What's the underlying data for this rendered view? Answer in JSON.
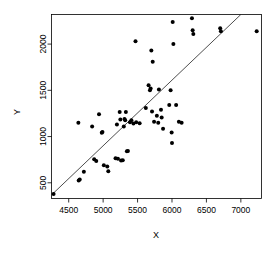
{
  "chart_data": {
    "type": "scatter",
    "title": "",
    "xlabel": "X",
    "ylabel": "Y",
    "xlim": [
      4250,
      7300
    ],
    "ylim": [
      330,
      2320
    ],
    "grid": false,
    "legend": null,
    "xticks": [
      4500,
      5000,
      5500,
      6000,
      6500,
      7000
    ],
    "yticks": [
      500,
      1000,
      1500,
      2000
    ],
    "point_color": "#000000",
    "line_color": "#000000",
    "reference_line": {
      "description": "diagonal regression line",
      "x_start": 4260,
      "y_start": 375,
      "x_end": 7000,
      "y_end": 2320
    },
    "points": [
      {
        "x": 4280,
        "y": 380
      },
      {
        "x": 4640,
        "y": 1150
      },
      {
        "x": 4645,
        "y": 525
      },
      {
        "x": 4660,
        "y": 535
      },
      {
        "x": 4720,
        "y": 620
      },
      {
        "x": 4840,
        "y": 1110
      },
      {
        "x": 4870,
        "y": 755
      },
      {
        "x": 4900,
        "y": 735
      },
      {
        "x": 4940,
        "y": 1240
      },
      {
        "x": 4980,
        "y": 1040
      },
      {
        "x": 4990,
        "y": 1050
      },
      {
        "x": 5010,
        "y": 690
      },
      {
        "x": 5060,
        "y": 675
      },
      {
        "x": 5075,
        "y": 625
      },
      {
        "x": 5180,
        "y": 765
      },
      {
        "x": 5200,
        "y": 1130
      },
      {
        "x": 5215,
        "y": 760
      },
      {
        "x": 5240,
        "y": 1265
      },
      {
        "x": 5250,
        "y": 1185
      },
      {
        "x": 5260,
        "y": 740
      },
      {
        "x": 5285,
        "y": 745
      },
      {
        "x": 5300,
        "y": 1110
      },
      {
        "x": 5310,
        "y": 1190
      },
      {
        "x": 5320,
        "y": 1175
      },
      {
        "x": 5330,
        "y": 1265
      },
      {
        "x": 5345,
        "y": 840
      },
      {
        "x": 5360,
        "y": 845
      },
      {
        "x": 5390,
        "y": 1155
      },
      {
        "x": 5410,
        "y": 1175
      },
      {
        "x": 5440,
        "y": 1140
      },
      {
        "x": 5470,
        "y": 2030
      },
      {
        "x": 5480,
        "y": 1155
      },
      {
        "x": 5530,
        "y": 1145
      },
      {
        "x": 5620,
        "y": 1310
      },
      {
        "x": 5660,
        "y": 1555
      },
      {
        "x": 5680,
        "y": 1500
      },
      {
        "x": 5690,
        "y": 1520
      },
      {
        "x": 5700,
        "y": 1930
      },
      {
        "x": 5710,
        "y": 1270
      },
      {
        "x": 5720,
        "y": 1810
      },
      {
        "x": 5740,
        "y": 1160
      },
      {
        "x": 5780,
        "y": 1225
      },
      {
        "x": 5800,
        "y": 1150
      },
      {
        "x": 5810,
        "y": 1510
      },
      {
        "x": 5840,
        "y": 1290
      },
      {
        "x": 5850,
        "y": 1205
      },
      {
        "x": 5870,
        "y": 1085
      },
      {
        "x": 5960,
        "y": 1340
      },
      {
        "x": 5980,
        "y": 1500
      },
      {
        "x": 5995,
        "y": 1045
      },
      {
        "x": 6000,
        "y": 930
      },
      {
        "x": 6010,
        "y": 2240
      },
      {
        "x": 6020,
        "y": 2000
      },
      {
        "x": 6060,
        "y": 1340
      },
      {
        "x": 6100,
        "y": 1160
      },
      {
        "x": 6140,
        "y": 1150
      },
      {
        "x": 6290,
        "y": 2280
      },
      {
        "x": 6300,
        "y": 2150
      },
      {
        "x": 6310,
        "y": 2110
      },
      {
        "x": 6700,
        "y": 2170
      },
      {
        "x": 6710,
        "y": 2140
      },
      {
        "x": 7230,
        "y": 2140
      }
    ]
  },
  "axis": {
    "x_title": "X",
    "y_title": "Y",
    "x_tick_labels": [
      "4500",
      "5000",
      "5500",
      "6000",
      "6500",
      "7000"
    ],
    "y_tick_labels": [
      "500",
      "1000",
      "1500",
      "2000"
    ]
  }
}
